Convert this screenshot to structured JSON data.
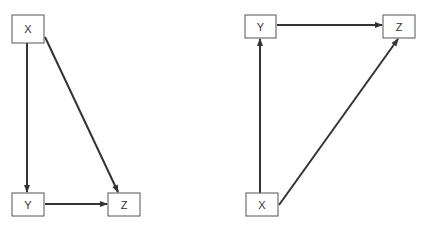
{
  "diagrams": [
    {
      "name": "left-diagram",
      "nodes": [
        {
          "id": "X",
          "label": "X"
        },
        {
          "id": "Y",
          "label": "Y"
        },
        {
          "id": "Z",
          "label": "Z"
        }
      ],
      "edges": [
        {
          "from": "X",
          "to": "Y"
        },
        {
          "from": "X",
          "to": "Z"
        },
        {
          "from": "Y",
          "to": "Z"
        }
      ]
    },
    {
      "name": "right-diagram",
      "nodes": [
        {
          "id": "Y",
          "label": "Y"
        },
        {
          "id": "Z",
          "label": "Z"
        },
        {
          "id": "X",
          "label": "X"
        }
      ],
      "edges": [
        {
          "from": "Y",
          "to": "Z"
        },
        {
          "from": "X",
          "to": "Y"
        },
        {
          "from": "X",
          "to": "Z"
        }
      ]
    }
  ]
}
